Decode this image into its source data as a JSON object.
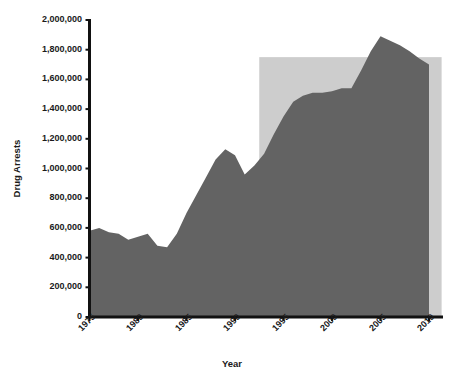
{
  "chart_data": {
    "type": "area",
    "title": "",
    "xlabel": "Year",
    "ylabel": "Drug Arrests",
    "xlim": [
      1975,
      2010
    ],
    "ylim": [
      0,
      2000000
    ],
    "grid": false,
    "legend": "none",
    "x_tick_labels": [
      "1975",
      "1980",
      "1985",
      "1990",
      "1995",
      "2000",
      "2005",
      "2010"
    ],
    "x_ticks": [
      1975,
      1980,
      1985,
      1990,
      1995,
      2000,
      2005,
      2010
    ],
    "y_tick_labels": [
      "0",
      "200,000",
      "400,000",
      "600,000",
      "800,000",
      "1,000,000",
      "1,200,000",
      "1,400,000",
      "1,600,000",
      "1,800,000",
      "2,000,000"
    ],
    "y_ticks": [
      0,
      200000,
      400000,
      600000,
      800000,
      1000000,
      1200000,
      1400000,
      1600000,
      1800000,
      2000000
    ],
    "series": [
      {
        "name": "Drug Arrests",
        "color": "#636363",
        "x": [
          1975,
          1976,
          1977,
          1978,
          1979,
          1980,
          1981,
          1982,
          1983,
          1984,
          1985,
          1986,
          1987,
          1988,
          1989,
          1990,
          1991,
          1992,
          1993,
          1994,
          1995,
          1996,
          1997,
          1998,
          1999,
          2000,
          2001,
          2002,
          2003,
          2004,
          2005,
          2006,
          2007,
          2008,
          2009,
          2010
        ],
        "values": [
          580000,
          600000,
          570000,
          560000,
          520000,
          540000,
          560000,
          480000,
          470000,
          560000,
          700000,
          820000,
          940000,
          1060000,
          1130000,
          1090000,
          960000,
          1020000,
          1100000,
          1230000,
          1350000,
          1450000,
          1490000,
          1510000,
          1510000,
          1520000,
          1540000,
          1540000,
          1660000,
          1790000,
          1890000,
          1860000,
          1830000,
          1790000,
          1740000,
          1700000
        ]
      }
    ],
    "shaded_band": {
      "name": "highlight-band",
      "color": "#cdcdcd",
      "x_start": 1992.5,
      "x_end": 2011.3,
      "y_top": 1750000,
      "y_bottom": 0
    },
    "axis_color": "#111111",
    "background": "#ffffff"
  },
  "axis": {
    "y_title": "Drug Arrests",
    "x_title": "Year"
  }
}
